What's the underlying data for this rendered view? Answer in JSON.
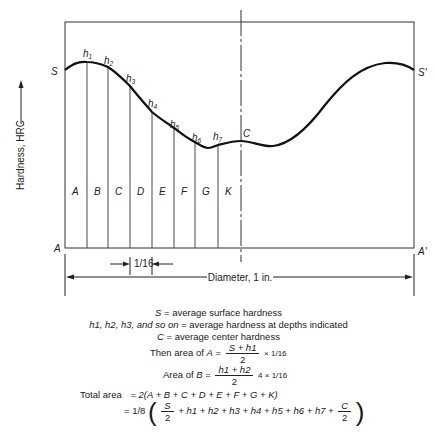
{
  "diagram": {
    "y_axis_label": "Hardness, HRC",
    "corner_labels": {
      "top_left": "S",
      "top_right": "S'",
      "bottom_left": "A",
      "bottom_right": "A'"
    },
    "center_label": "C",
    "depth_labels": [
      {
        "base": "h",
        "sub": "1"
      },
      {
        "base": "h",
        "sub": "2"
      },
      {
        "base": "h",
        "sub": "3"
      },
      {
        "base": "h",
        "sub": "4"
      },
      {
        "base": "h",
        "sub": "5"
      },
      {
        "base": "h",
        "sub": "6"
      },
      {
        "base": "h",
        "sub": "7"
      }
    ],
    "segment_labels": [
      "A",
      "B",
      "C",
      "D",
      "E",
      "F",
      "G",
      "K"
    ],
    "increment_label": "1/16",
    "diameter_label": "Diameter, 1 in."
  },
  "legend": {
    "line1": {
      "symbol": "S",
      "text": " = average surface hardness"
    },
    "line2": {
      "symbols": "h1, h2, h3, and so on",
      "text": " = average hardness at depths indicated"
    },
    "line3": {
      "symbol": "C",
      "text": " = average center hardness"
    }
  },
  "formulas": {
    "area_a_prefix": "Then area of ",
    "area_a_var": "A",
    "area_a_num": "S + h1",
    "area_a_den": "2",
    "area_a_suffix": "× 1/16",
    "area_b_prefix": "Area of ",
    "area_b_var": "B",
    "area_b_num": "h1 + h2",
    "area_b_den": "2",
    "area_b_suffix": "4 × 1/16",
    "total_label": "Total area",
    "total_line1": "= 2(A + B + C + D + E + F + G + K)",
    "total_line2_prefix": "= 1/8",
    "total_line2_terms": "+ h1 + h2 + h3 + h4 + h5 + h6 + h7 +",
    "s_over_2_num": "S",
    "s_over_2_den": "2",
    "c_over_2_num": "C",
    "c_over_2_den": "2"
  }
}
